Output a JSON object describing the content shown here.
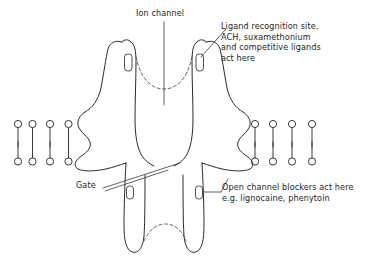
{
  "figure": {
    "background_color": "#ffffff",
    "ink_color": "#2b2b2b"
  },
  "labels": {
    "ion_channel": {
      "text": "Ion channel",
      "lines": [
        "Ion channel"
      ]
    },
    "ligand_site": {
      "lines": [
        "Ligand recognition site.",
        "ACH, suxamethonium",
        "and competitive ligands",
        "act here"
      ]
    },
    "gate": {
      "text": "Gate",
      "lines": [
        "Gate"
      ]
    },
    "open_channel_blockers": {
      "lines": [
        "Open channel blockers act here",
        "e.g. lignocaine, phenytoin"
      ]
    }
  },
  "structures": {
    "lipid_bilayer_left_count": 4,
    "lipid_bilayer_right_count": 4,
    "receptor_subunits": 2,
    "ligand_binding_pockets": 2,
    "blocker_binding_pockets": 2,
    "vestibule_dashed_arcs": 2
  }
}
